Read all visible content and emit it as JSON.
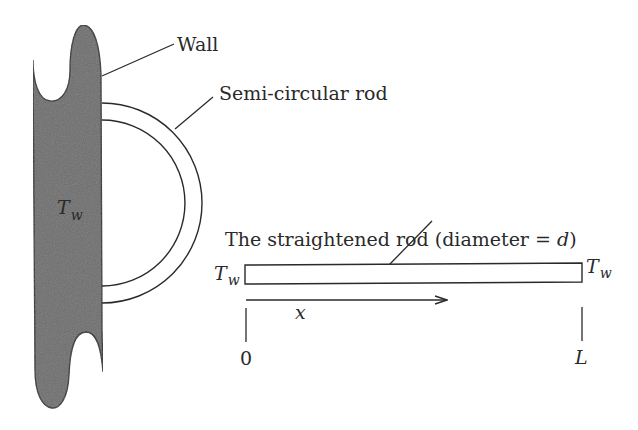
{
  "figure": {
    "labels": {
      "wall": "Wall",
      "semi_rod": "Semi-circular rod",
      "straight_rod": "The straightened rod (diameter = ",
      "straight_rod_var": "d",
      "straight_rod_close": ")",
      "wall_temp_T": "T",
      "wall_temp_sub": "w",
      "left_end_T": "T",
      "left_end_sub": "w",
      "right_end_T": "T",
      "right_end_sub": "w",
      "x_axis": "x",
      "origin": "0",
      "length": "L"
    },
    "colors": {
      "wall_fill": "#6e6e6e",
      "stroke": "#2a2a2a",
      "background": "#ffffff"
    }
  }
}
